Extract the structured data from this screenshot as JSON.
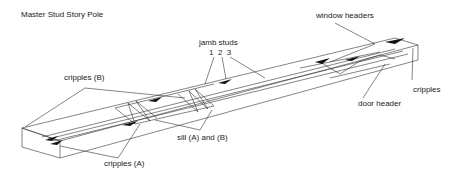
{
  "title": "Master Stud Story Pole",
  "labels": {
    "jamb_studs": "jamb studs",
    "jamb_numbers": "1  2  3",
    "window_headers": "window headers",
    "cripples_b": "cripples (B)",
    "cripples_right": "cripples",
    "door_header": "door header",
    "sill": "sill (A) and (B)",
    "cripples_a": "cripples (A)"
  },
  "colors": {
    "line": "#333333",
    "marker": "#111111"
  }
}
